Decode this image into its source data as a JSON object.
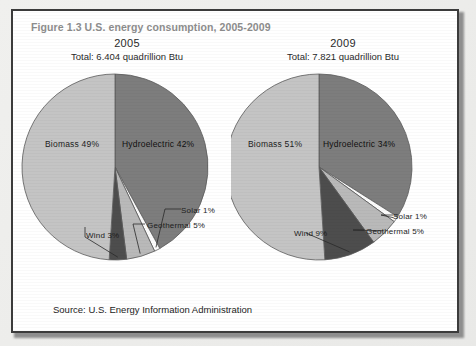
{
  "figure": {
    "title": "Figure 1.3 U.S. energy consumption, 2005-2009",
    "source": "Source:  U.S. Energy Information Administration"
  },
  "panels": [
    {
      "year": "2005",
      "total": "Total:  6.404 quadrillion Btu",
      "labels": {
        "biomass": "Biomass  49%",
        "hydroelectric": "Hydroelectric  42%",
        "solar": "Solar  1%",
        "geothermal": "Geothermal  5%",
        "wind": "Wind  3%"
      }
    },
    {
      "year": "2009",
      "total": "Total:  7.821 quadrillion Btu",
      "labels": {
        "biomass": "Biomass  51%",
        "hydroelectric": "Hydroelectric  34%",
        "solar": "Solar  1%",
        "geothermal": "Geothermal  5%",
        "wind": "Wind  9%"
      }
    }
  ],
  "colors": {
    "biomass": "#c4c4c4",
    "hydroelectric": "#7d7d7d",
    "geothermal": "#b9b9b9",
    "solar": "#fbfbfb",
    "wind": "#4d4d4d",
    "outline": "#5a5a5a",
    "title": "#8d8d8d",
    "frame": "#3b3b3b"
  },
  "chart_data": [
    {
      "type": "pie",
      "title": "2005",
      "subtitle": "Total:  6.404 quadrillion Btu",
      "categories": [
        "Hydroelectric",
        "Solar",
        "Geothermal",
        "Wind",
        "Biomass"
      ],
      "values": [
        42,
        1,
        5,
        3,
        49
      ],
      "unit": "percent",
      "total_label": "6.404 quadrillion Btu",
      "legend": "none (direct labels)",
      "start_angle_deg": 0,
      "direction": "clockwise"
    },
    {
      "type": "pie",
      "title": "2009",
      "subtitle": "Total:  7.821 quadrillion Btu",
      "categories": [
        "Hydroelectric",
        "Solar",
        "Geothermal",
        "Wind",
        "Biomass"
      ],
      "values": [
        34,
        1,
        5,
        9,
        51
      ],
      "unit": "percent",
      "total_label": "7.821 quadrillion Btu",
      "legend": "none (direct labels)",
      "start_angle_deg": 0,
      "direction": "clockwise"
    }
  ]
}
